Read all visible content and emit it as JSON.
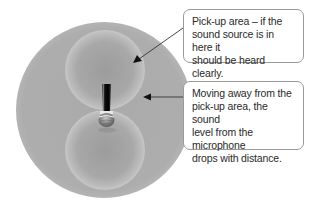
{
  "diagram": {
    "callouts": [
      {
        "id": "pickup-area",
        "text": "Pick-up area – if the\nsound source is in here it\nshould be heard clearly."
      },
      {
        "id": "distance-falloff",
        "text": "Moving away from the\npick-up area, the sound\nlevel from the microphone\ndrops with distance."
      }
    ],
    "icons": {
      "microphone": "microphone-icon",
      "arrow": "arrow-icon"
    },
    "colors": {
      "outer_field": "#acacac",
      "lobe_rim": "#c6c6c6",
      "lobe_center": "#9e9e9e",
      "mic_body": "#111111",
      "mic_grille": "#8a8a8a",
      "arrow": "#222222",
      "callout_border": "#9a9a9a"
    }
  }
}
